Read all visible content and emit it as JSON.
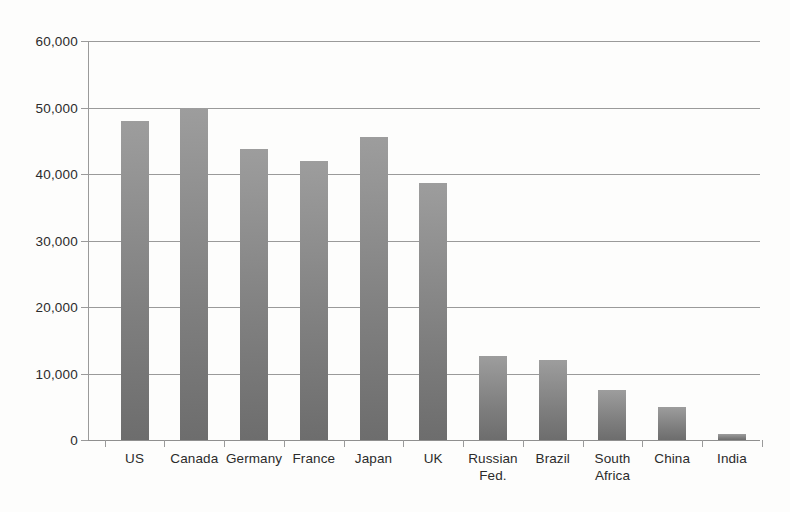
{
  "chart_data": {
    "type": "bar",
    "title": "",
    "subtitle": "",
    "xlabel": "",
    "ylabel": "",
    "categories": [
      "US",
      "Canada",
      "Germany",
      "France",
      "Japan",
      "UK",
      "Russian Fed.",
      "Brazil",
      "South Africa",
      "China",
      "India"
    ],
    "category_lines": [
      [
        "US"
      ],
      [
        "Canada"
      ],
      [
        "Germany"
      ],
      [
        "France"
      ],
      [
        "Japan"
      ],
      [
        "UK"
      ],
      [
        "Russian",
        "Fed."
      ],
      [
        "Brazil"
      ],
      [
        "South",
        "Africa"
      ],
      [
        "China"
      ],
      [
        "India"
      ]
    ],
    "values": [
      48000,
      50000,
      43800,
      42000,
      45500,
      38600,
      12600,
      12100,
      7500,
      5000,
      900
    ],
    "ylim": [
      0,
      60000
    ],
    "ytick_values": [
      0,
      10000,
      20000,
      30000,
      40000,
      50000,
      60000
    ],
    "ytick_labels": [
      "0",
      "10,000",
      "20,000",
      "30,000",
      "40,000",
      "50,000",
      "60,000"
    ],
    "grid": true,
    "legend": false,
    "legend_position": "none",
    "bar_color_top": "#9d9d9d",
    "bar_color_bottom": "#6d6d6d",
    "gridline_color": "#9a9a9a",
    "background_color": "#fdfdfc",
    "text_color": "#2b2b2b"
  }
}
